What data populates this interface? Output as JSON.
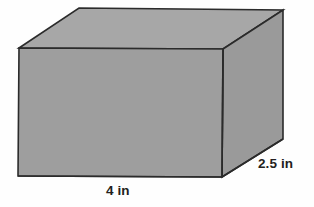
{
  "figure": {
    "kind": "rectangular-prism",
    "colors": {
      "front_face": "#9e9e9e",
      "top_face": "#a7a7a7",
      "side_face": "#9a9a9a",
      "edge_stroke": "#2b2b2b",
      "background": "#fefefe",
      "label_text": "#231f20"
    },
    "geometry": {
      "front_top_left": [
        19,
        48
      ],
      "front_top_right": [
        223,
        49
      ],
      "front_bottom_right": [
        222,
        177
      ],
      "front_bottom_left": [
        18,
        176
      ],
      "back_top_left": [
        79,
        8
      ],
      "back_top_right": [
        283,
        10
      ],
      "back_bottom_right": [
        283,
        139
      ]
    }
  },
  "labels": {
    "width": "4 in",
    "depth": "2.5 in"
  }
}
